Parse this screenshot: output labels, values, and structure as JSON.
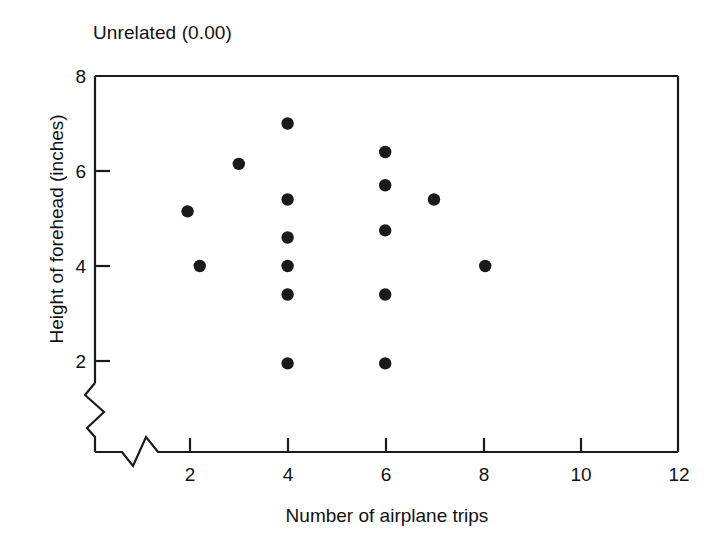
{
  "chart_data": {
    "type": "scatter",
    "title": "Unrelated (0.00)",
    "xlabel": "Number of airplane trips",
    "ylabel": "Height of forehead (inches)",
    "xlim": [
      1,
      12
    ],
    "ylim": [
      1.4,
      8
    ],
    "x_ticks": [
      2,
      4,
      6,
      8,
      10,
      12
    ],
    "y_ticks": [
      2,
      4,
      6,
      8
    ],
    "x_tick_labels": [
      "2",
      "4",
      "6",
      "8",
      "10",
      "12"
    ],
    "y_tick_labels": [
      "2",
      "4",
      "6",
      "8"
    ],
    "grid": false,
    "legend": "none",
    "axis_break_x": true,
    "axis_break_y": true,
    "correlation": "0.00",
    "marker": "filled-circle",
    "marker_color": "#1a1a1a",
    "points": [
      {
        "x": 1.95,
        "y": 5.15
      },
      {
        "x": 2.2,
        "y": 4.0
      },
      {
        "x": 3.0,
        "y": 6.15
      },
      {
        "x": 4.0,
        "y": 7.0
      },
      {
        "x": 4.0,
        "y": 5.4
      },
      {
        "x": 4.0,
        "y": 4.6
      },
      {
        "x": 4.0,
        "y": 4.0
      },
      {
        "x": 4.0,
        "y": 3.4
      },
      {
        "x": 4.0,
        "y": 1.95
      },
      {
        "x": 6.0,
        "y": 6.4
      },
      {
        "x": 6.0,
        "y": 5.7
      },
      {
        "x": 6.0,
        "y": 4.75
      },
      {
        "x": 6.0,
        "y": 3.4
      },
      {
        "x": 6.0,
        "y": 1.95
      },
      {
        "x": 7.0,
        "y": 5.4
      },
      {
        "x": 8.05,
        "y": 4.0
      }
    ]
  }
}
